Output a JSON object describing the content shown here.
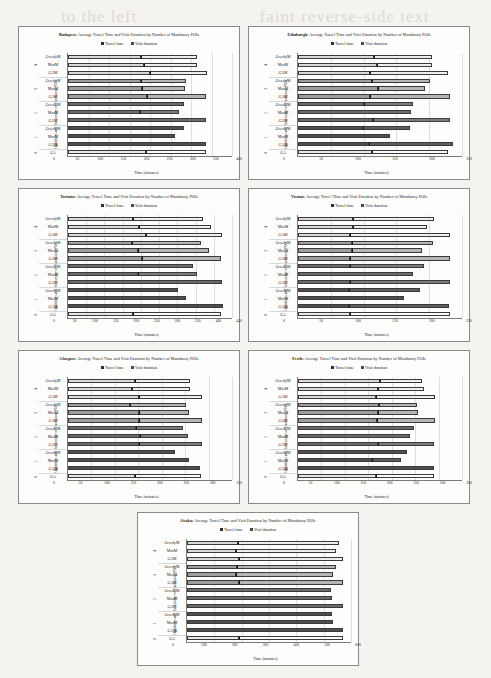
{
  "page": {
    "bleed_text_left": "to the left",
    "bleed_text_right": "faint reverse-side text"
  },
  "legend": {
    "travel_label": "Travel time",
    "visit_label": "Visit duration",
    "travel_color": "#2f2f2f",
    "visit_color": "#4a4a4a"
  },
  "labels": {
    "title_suffix": ": Average Travel Time and Visit Duration by Number of Mandatory POIs",
    "ylabel": "Algorithms and the number of Mandatory POIs",
    "xlabel": "Time (minutes)",
    "categories": [
      "GreedyM",
      "MaxM",
      "GAM"
    ],
    "ga_label": "GA",
    "group_numbers": [
      "4",
      "3",
      "2",
      "1",
      "0"
    ]
  },
  "group_shades": [
    "#d9d9d9",
    "#9e9e9e",
    "#6b6b6b",
    "#4f4f4f",
    "#e8e8e8"
  ],
  "chart_data": [
    {
      "type": "bar",
      "orientation": "horizontal",
      "stacked": true,
      "city": "Budapest",
      "title": "Budapest: Average Travel Time and Visit Duration by Number of Mandatory POIs",
      "xlabel": "Time (minutes)",
      "ylabel": "Algorithms and the number of Mandatory POIs",
      "xlim": [
        0,
        400
      ],
      "xticks": [
        0,
        50,
        100,
        150,
        200,
        250,
        300,
        350,
        400
      ],
      "legend": [
        "Travel time",
        "Visit duration"
      ],
      "rows": [
        {
          "group": "4",
          "algo": "GreedyM",
          "travel": 178,
          "visit": 137,
          "total": 315
        },
        {
          "group": "4",
          "algo": "MaxM",
          "travel": 186,
          "visit": 128,
          "total": 314
        },
        {
          "group": "4",
          "algo": "GAM",
          "travel": 199,
          "visit": 140,
          "total": 339
        },
        {
          "group": "3",
          "algo": "GreedyM",
          "travel": 178,
          "visit": 110,
          "total": 288
        },
        {
          "group": "3",
          "algo": "MaxM",
          "travel": 180,
          "visit": 105,
          "total": 285
        },
        {
          "group": "3",
          "algo": "GAM",
          "travel": 192,
          "visit": 145,
          "total": 337
        },
        {
          "group": "2",
          "algo": "GreedyM",
          "travel": 283,
          "visit": 0,
          "total": 283
        },
        {
          "group": "2",
          "algo": "MaxM",
          "travel": 176,
          "visit": 94,
          "total": 270
        },
        {
          "group": "2",
          "algo": "GAM",
          "travel": 337,
          "visit": 0,
          "total": 337
        },
        {
          "group": "1",
          "algo": "GreedyM",
          "travel": 284,
          "visit": 0,
          "total": 284
        },
        {
          "group": "1",
          "algo": "MaxM",
          "travel": 262,
          "visit": 0,
          "total": 262
        },
        {
          "group": "1",
          "algo": "GAM",
          "travel": 337,
          "visit": 0,
          "total": 337
        },
        {
          "group": "0",
          "algo": "GA",
          "travel": 190,
          "visit": 147,
          "total": 337
        }
      ]
    },
    {
      "type": "bar",
      "orientation": "horizontal",
      "stacked": true,
      "city": "Edinburgh",
      "title": "Edinburgh: Average Travel Time and Visit Duration by Number of Mandatory POIs",
      "xlabel": "Time (minutes)",
      "ylabel": "Algorithms and the number of Mandatory POIs",
      "xlim": [
        0,
        250
      ],
      "xticks": [
        0,
        50,
        100,
        150,
        200,
        250
      ],
      "legend": [
        "Travel time",
        "Visit duration"
      ],
      "rows": [
        {
          "group": "4",
          "algo": "GreedyM",
          "travel": 116,
          "visit": 89,
          "total": 205
        },
        {
          "group": "4",
          "algo": "MaxM",
          "travel": 121,
          "visit": 83,
          "total": 204
        },
        {
          "group": "4",
          "algo": "GAM",
          "travel": 109,
          "visit": 119,
          "total": 228
        },
        {
          "group": "3",
          "algo": "GreedyM",
          "travel": 113,
          "visit": 89,
          "total": 202
        },
        {
          "group": "3",
          "algo": "MaxM",
          "travel": 122,
          "visit": 72,
          "total": 194
        },
        {
          "group": "3",
          "algo": "GAM",
          "travel": 110,
          "visit": 122,
          "total": 232
        },
        {
          "group": "2",
          "algo": "GreedyM",
          "travel": 101,
          "visit": 75,
          "total": 176
        },
        {
          "group": "2",
          "algo": "MaxM",
          "travel": 172,
          "visit": 0,
          "total": 172
        },
        {
          "group": "2",
          "algo": "GAM",
          "travel": 114,
          "visit": 117,
          "total": 231
        },
        {
          "group": "1",
          "algo": "GreedyM",
          "travel": 99,
          "visit": 71,
          "total": 170
        },
        {
          "group": "1",
          "algo": "MaxM",
          "travel": 140,
          "visit": 0,
          "total": 140
        },
        {
          "group": "1",
          "algo": "GAM",
          "travel": 108,
          "visit": 128,
          "total": 236
        },
        {
          "group": "0",
          "algo": "GA",
          "travel": 113,
          "visit": 116,
          "total": 229
        }
      ]
    },
    {
      "type": "bar",
      "orientation": "horizontal",
      "stacked": true,
      "city": "Toronto",
      "title": "Toronto: Average Travel Time and Visit Duration by Number of Mandatory POIs",
      "xlabel": "Time (minutes)",
      "ylabel": "Algorithms and the number of Mandatory POIs",
      "xlim": [
        0,
        450
      ],
      "xticks": [
        0,
        50,
        100,
        150,
        200,
        250,
        300,
        350,
        400,
        450
      ],
      "legend": [
        "Travel time",
        "Visit duration"
      ],
      "rows": [
        {
          "group": "4",
          "algo": "GreedyM",
          "travel": 178,
          "visit": 192,
          "total": 370
        },
        {
          "group": "4",
          "algo": "MaxM",
          "travel": 196,
          "visit": 196,
          "total": 392
        },
        {
          "group": "4",
          "algo": "GAM",
          "travel": 214,
          "visit": 209,
          "total": 423
        },
        {
          "group": "3",
          "algo": "GreedyM",
          "travel": 175,
          "visit": 190,
          "total": 365
        },
        {
          "group": "3",
          "algo": "MaxM",
          "travel": 192,
          "visit": 195,
          "total": 387
        },
        {
          "group": "3",
          "algo": "GAM",
          "travel": 203,
          "visit": 217,
          "total": 420
        },
        {
          "group": "2",
          "algo": "GreedyM",
          "travel": 343,
          "visit": 0,
          "total": 343
        },
        {
          "group": "2",
          "algo": "MaxM",
          "travel": 192,
          "visit": 163,
          "total": 355
        },
        {
          "group": "2",
          "algo": "GAM",
          "travel": 422,
          "visit": 0,
          "total": 422
        },
        {
          "group": "1",
          "algo": "GreedyM",
          "travel": 303,
          "visit": 0,
          "total": 303
        },
        {
          "group": "1",
          "algo": "MaxM",
          "travel": 325,
          "visit": 0,
          "total": 325
        },
        {
          "group": "1",
          "algo": "GAM",
          "travel": 424,
          "visit": 0,
          "total": 424
        },
        {
          "group": "0",
          "algo": "GA",
          "travel": 177,
          "visit": 244,
          "total": 421
        }
      ]
    },
    {
      "type": "bar",
      "orientation": "horizontal",
      "stacked": true,
      "city": "Vienna",
      "title": "Vienna: Average Travel Time and Visit Duration by Number of Mandatory POIs",
      "xlabel": "Time (minutes)",
      "ylabel": "Algorithms and the number of Mandatory POIs",
      "xlim": [
        0,
        250
      ],
      "xticks": [
        0,
        50,
        100,
        150,
        200,
        250
      ],
      "legend": [
        "Travel time",
        "Visit duration"
      ],
      "rows": [
        {
          "group": "4",
          "algo": "GreedyM",
          "travel": 84,
          "visit": 124,
          "total": 208
        },
        {
          "group": "4",
          "algo": "MaxM",
          "travel": 84,
          "visit": 112,
          "total": 196
        },
        {
          "group": "4",
          "algo": "GAM",
          "travel": 80,
          "visit": 152,
          "total": 232
        },
        {
          "group": "3",
          "algo": "GreedyM",
          "travel": 82,
          "visit": 124,
          "total": 206
        },
        {
          "group": "3",
          "algo": "MaxM",
          "travel": 82,
          "visit": 107,
          "total": 189
        },
        {
          "group": "3",
          "algo": "GAM",
          "travel": 79,
          "visit": 152,
          "total": 231
        },
        {
          "group": "2",
          "algo": "GreedyM",
          "travel": 80,
          "visit": 112,
          "total": 192
        },
        {
          "group": "2",
          "algo": "MaxM",
          "travel": 176,
          "visit": 0,
          "total": 176
        },
        {
          "group": "2",
          "algo": "GAM",
          "travel": 79,
          "visit": 153,
          "total": 232
        },
        {
          "group": "1",
          "algo": "GreedyM",
          "travel": 78,
          "visit": 108,
          "total": 186
        },
        {
          "group": "1",
          "algo": "MaxM",
          "travel": 161,
          "visit": 0,
          "total": 161
        },
        {
          "group": "1",
          "algo": "GAM",
          "travel": 78,
          "visit": 152,
          "total": 230
        },
        {
          "group": "0",
          "algo": "GA",
          "travel": 80,
          "visit": 152,
          "total": 232
        }
      ]
    },
    {
      "type": "bar",
      "orientation": "horizontal",
      "stacked": true,
      "city": "Glasgow",
      "title": "Glasgow: Average Travel Time and Visit Duration by Number of Mandatory POIs",
      "xlabel": "Time (minutes)",
      "ylabel": "Algorithms and the number of Mandatory POIs",
      "xlim": [
        0,
        350
      ],
      "xticks": [
        0,
        50,
        100,
        150,
        200,
        250,
        300,
        350
      ],
      "legend": [
        "Travel time",
        "Visit duration"
      ],
      "rows": [
        {
          "group": "4",
          "algo": "GreedyM",
          "travel": 144,
          "visit": 117,
          "total": 261
        },
        {
          "group": "4",
          "algo": "MaxM",
          "travel": 137,
          "visit": 124,
          "total": 261
        },
        {
          "group": "4",
          "algo": "GAM",
          "travel": 152,
          "visit": 133,
          "total": 285
        },
        {
          "group": "3",
          "algo": "GreedyM",
          "travel": 133,
          "visit": 118,
          "total": 251
        },
        {
          "group": "3",
          "algo": "MaxM",
          "travel": 151,
          "visit": 108,
          "total": 259
        },
        {
          "group": "3",
          "algo": "GAM",
          "travel": 152,
          "visit": 133,
          "total": 285
        },
        {
          "group": "2",
          "algo": "GreedyM",
          "travel": 146,
          "visit": 99,
          "total": 245
        },
        {
          "group": "2",
          "algo": "MaxM",
          "travel": 153,
          "visit": 104,
          "total": 257
        },
        {
          "group": "2",
          "algo": "GAM",
          "travel": 152,
          "visit": 133,
          "total": 285
        },
        {
          "group": "1",
          "algo": "GreedyM",
          "travel": 228,
          "visit": 0,
          "total": 228
        },
        {
          "group": "1",
          "algo": "MaxM",
          "travel": 259,
          "visit": 0,
          "total": 259
        },
        {
          "group": "1",
          "algo": "GAM",
          "travel": 282,
          "visit": 0,
          "total": 282
        },
        {
          "group": "0",
          "algo": "GA",
          "travel": 142,
          "visit": 142,
          "total": 284
        }
      ]
    },
    {
      "type": "bar",
      "orientation": "horizontal",
      "stacked": true,
      "city": "Perth",
      "title": "Perth: Average Travel Time and Visit Duration by Number of Mandatory POIs",
      "xlabel": "Time (minutes)",
      "ylabel": "Algorithms and the number of Mandatory POIs",
      "xlim": [
        0,
        350
      ],
      "xticks": [
        0,
        50,
        100,
        150,
        200,
        250,
        300,
        350
      ],
      "legend": [
        "Travel time",
        "Visit duration"
      ],
      "rows": [
        {
          "group": "4",
          "algo": "GreedyM",
          "travel": 174,
          "visit": 91,
          "total": 265
        },
        {
          "group": "4",
          "algo": "MaxM",
          "travel": 170,
          "visit": 98,
          "total": 268
        },
        {
          "group": "4",
          "algo": "GAM",
          "travel": 167,
          "visit": 125,
          "total": 292
        },
        {
          "group": "3",
          "algo": "GreedyM",
          "travel": 172,
          "visit": 82,
          "total": 254
        },
        {
          "group": "3",
          "algo": "MaxM",
          "travel": 170,
          "visit": 86,
          "total": 256
        },
        {
          "group": "3",
          "algo": "GAM",
          "travel": 168,
          "visit": 124,
          "total": 292
        },
        {
          "group": "2",
          "algo": "GreedyM",
          "travel": 247,
          "visit": 0,
          "total": 247
        },
        {
          "group": "2",
          "algo": "MaxM",
          "travel": 238,
          "visit": 0,
          "total": 238
        },
        {
          "group": "2",
          "algo": "GAM",
          "travel": 170,
          "visit": 121,
          "total": 291
        },
        {
          "group": "1",
          "algo": "GreedyM",
          "travel": 233,
          "visit": 0,
          "total": 233
        },
        {
          "group": "1",
          "algo": "MaxM",
          "travel": 158,
          "visit": 62,
          "total": 220
        },
        {
          "group": "1",
          "algo": "GAM",
          "travel": 291,
          "visit": 0,
          "total": 291
        },
        {
          "group": "0",
          "algo": "GA",
          "travel": 167,
          "visit": 124,
          "total": 291
        }
      ]
    },
    {
      "type": "bar",
      "orientation": "horizontal",
      "stacked": true,
      "city": "Osaka",
      "title": "Osaka: Average Travel Time and Visit Duration by Number of Mandatory POIs",
      "xlabel": "Time (minutes)",
      "ylabel": "Algorithms and the number of Mandatory POIs",
      "xlim": [
        0,
        600
      ],
      "xticks": [
        0,
        100,
        200,
        300,
        400,
        500,
        600
      ],
      "legend": [
        "Travel time",
        "Visit duration"
      ],
      "rows": [
        {
          "group": "4",
          "algo": "GreedyM",
          "travel": 185,
          "visit": 370,
          "total": 555
        },
        {
          "group": "4",
          "algo": "MaxM",
          "travel": 181,
          "visit": 364,
          "total": 545
        },
        {
          "group": "4",
          "algo": "GAM",
          "travel": 191,
          "visit": 379,
          "total": 570
        },
        {
          "group": "3",
          "algo": "GreedyM",
          "travel": 184,
          "visit": 362,
          "total": 546
        },
        {
          "group": "3",
          "algo": "MaxM",
          "travel": 180,
          "visit": 353,
          "total": 533
        },
        {
          "group": "3",
          "algo": "GAM",
          "travel": 190,
          "visit": 380,
          "total": 570
        },
        {
          "group": "2",
          "algo": "GreedyM",
          "travel": 528,
          "visit": 0,
          "total": 528
        },
        {
          "group": "2",
          "algo": "MaxM",
          "travel": 530,
          "visit": 0,
          "total": 530
        },
        {
          "group": "2",
          "algo": "GAM",
          "travel": 569,
          "visit": 0,
          "total": 569
        },
        {
          "group": "1",
          "algo": "GreedyM",
          "travel": 529,
          "visit": 0,
          "total": 529
        },
        {
          "group": "1",
          "algo": "MaxM",
          "travel": 534,
          "visit": 0,
          "total": 534
        },
        {
          "group": "1",
          "algo": "GAM",
          "travel": 569,
          "visit": 0,
          "total": 569
        },
        {
          "group": "0",
          "algo": "GA",
          "travel": 190,
          "visit": 379,
          "total": 569
        }
      ]
    }
  ]
}
